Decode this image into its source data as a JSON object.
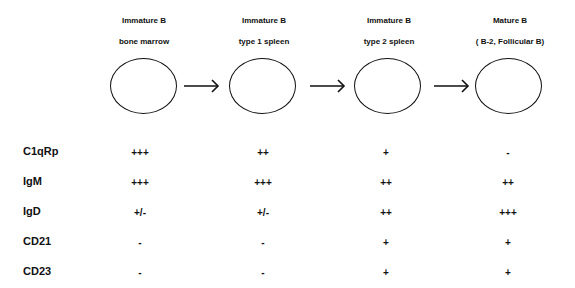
{
  "stages": [
    {
      "title": "Immature B",
      "subtitle": "bone marrow"
    },
    {
      "title": "Immature B",
      "subtitle": "type 1 spleen"
    },
    {
      "title": "Immature B",
      "subtitle": "type 2 spleen"
    },
    {
      "title": "Mature B",
      "subtitle": "( B-2, Follicular B)"
    }
  ],
  "arrow_icon": "right-arrow",
  "markers": [
    {
      "name": "C1qRp",
      "values": [
        "+++",
        "++",
        "+",
        "-"
      ]
    },
    {
      "name": "IgM",
      "values": [
        "+++",
        "+++",
        "++",
        "++"
      ]
    },
    {
      "name": "IgD",
      "values": [
        "+/-",
        "+/-",
        "++",
        "+++"
      ]
    },
    {
      "name": "CD21",
      "values": [
        "-",
        "-",
        "+",
        "+"
      ]
    },
    {
      "name": "CD23",
      "values": [
        "-",
        "-",
        "+",
        "+"
      ]
    }
  ]
}
